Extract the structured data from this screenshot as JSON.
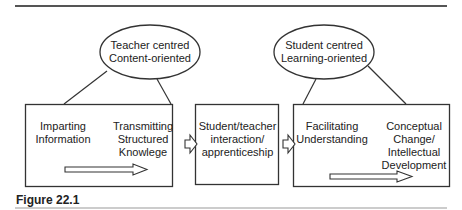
{
  "figure_caption": "Figure 22.1",
  "ellipses": [
    {
      "line1": "Teacher centred",
      "line2": "Content-oriented"
    },
    {
      "line1": "Student centred",
      "line2": "Learning-oriented"
    }
  ],
  "boxes": {
    "left": {
      "item1": {
        "line1": "Imparting",
        "line2": "Information"
      },
      "item2": {
        "line1": "Transmitting",
        "line2": "Structured",
        "line3": "Knowlege"
      }
    },
    "middle": {
      "line1": "Student/teacher",
      "line2": "interaction/",
      "line3": "apprenticeship"
    },
    "right": {
      "item1": {
        "line1": "Facilitating",
        "line2": "Understanding"
      },
      "item2": {
        "line1": "Conceptual",
        "line2": "Change/",
        "line3": "Intellectual",
        "line4": "Development"
      }
    }
  },
  "colors": {
    "line": "#333333",
    "rule": "#555555",
    "background": "#ffffff"
  }
}
